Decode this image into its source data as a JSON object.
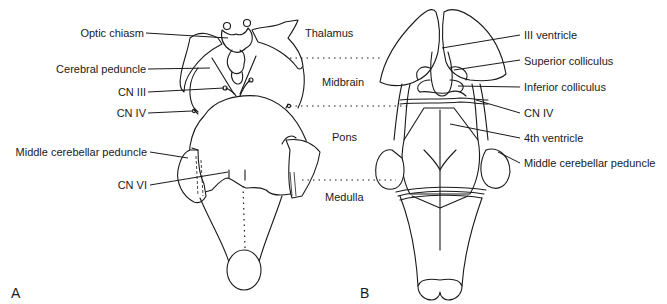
{
  "figure": {
    "panels": [
      {
        "id": "A",
        "label": "A",
        "view": "ventral brainstem"
      },
      {
        "id": "B",
        "label": "B",
        "view": "dorsal brainstem"
      }
    ],
    "regions": [
      "Thalamus",
      "Midbrain",
      "Pons",
      "Medulla"
    ],
    "labels_A": {
      "optic_chiasm": "Optic chiasm",
      "cerebral_peduncle": "Cerebral peduncle",
      "cn3": "CN III",
      "cn4": "CN IV",
      "middle_cerebellar_peduncle": "Middle cerebellar peduncle",
      "cn6": "CN VI"
    },
    "labels_B": {
      "third_ventricle": "III ventricle",
      "superior_colliculus": "Superior colliculus",
      "inferior_colliculus": "Inferior colliculus",
      "cn4": "CN IV",
      "fourth_ventricle": "4th ventricle",
      "middle_cerebellar_peduncle": "Middle cerebellar peduncle"
    }
  }
}
